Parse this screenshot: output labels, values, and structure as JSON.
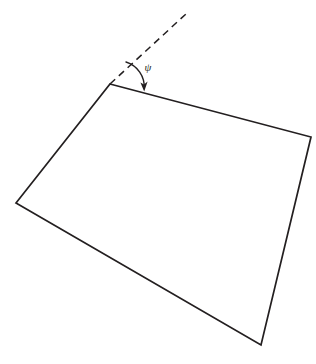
{
  "figure": {
    "kind": "geometry-diagram",
    "background_color": "#ffffff",
    "stroke_color": "#231f20",
    "canvas": {
      "width": 316,
      "height": 364
    },
    "angle": {
      "label": "ψ",
      "label_name": "psi",
      "label_x": 148,
      "label_y": 71,
      "arc_path": "M 126 62 A 26 26 0 0 1 144.2 88.6",
      "arrow_tip_x": 144,
      "arrow_tip_y": 91,
      "arrow_head_points": "144.2,91.5 140.4,82.4 144.0,84.6 147.6,81.6"
    },
    "reference_line": {
      "name": "dashed-reference-line",
      "x1": 110,
      "y1": 84,
      "x2": 187,
      "y2": 13,
      "dash_pattern": "7 5"
    },
    "quadrilateral": {
      "name": "quadrilateral-outline",
      "vertices": [
        {
          "name": "top-left-vertex",
          "x": 110,
          "y": 84
        },
        {
          "name": "right-vertex",
          "x": 311,
          "y": 137
        },
        {
          "name": "bottom-vertex",
          "x": 261,
          "y": 345
        },
        {
          "name": "left-vertex",
          "x": 16,
          "y": 203
        }
      ],
      "path": "M 110 84 L 311 137 L 261 345 L 16 203 Z"
    }
  }
}
